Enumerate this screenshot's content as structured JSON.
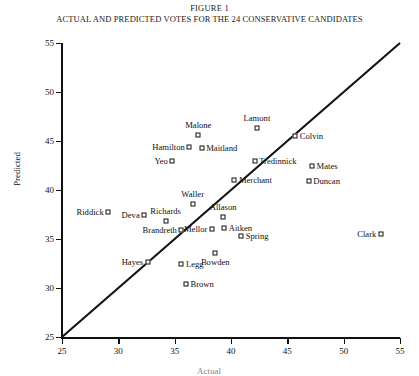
{
  "figure": {
    "title": "FIGURE 1",
    "subtitle": "ACTUAL AND PREDICTED VOTES FOR THE 24 CONSERVATIVE CANDIDATES"
  },
  "chart_data": {
    "type": "scatter",
    "title": "ACTUAL AND PREDICTED VOTES FOR THE 24 CONSERVATIVE CANDIDATES",
    "xlabel": "Actual",
    "ylabel": "Predicted",
    "xlim": [
      25,
      55
    ],
    "ylim": [
      25,
      55
    ],
    "xticks": [
      25,
      30,
      35,
      40,
      45,
      50,
      55
    ],
    "yticks": [
      25,
      30,
      35,
      40,
      45,
      50,
      55
    ],
    "grid": false,
    "legend": null,
    "reference_line": {
      "kind": "identity",
      "from": [
        25,
        25
      ],
      "to": [
        55,
        55
      ],
      "label": "y = x"
    },
    "points": [
      {
        "name": "Riddick",
        "x": 29.1,
        "y": 37.8,
        "label_side": "left"
      },
      {
        "name": "Deva",
        "x": 32.3,
        "y": 37.4,
        "label_side": "left"
      },
      {
        "name": "Richards",
        "x": 34.2,
        "y": 36.8,
        "label_side": "top"
      },
      {
        "name": "Brandreth",
        "x": 35.6,
        "y": 35.9,
        "label_side": "left"
      },
      {
        "name": "Hayes",
        "x": 32.6,
        "y": 32.7,
        "label_side": "left"
      },
      {
        "name": "Legg",
        "x": 35.6,
        "y": 32.4,
        "label_side": "right"
      },
      {
        "name": "Brown",
        "x": 36.0,
        "y": 30.4,
        "label_side": "right"
      },
      {
        "name": "Mellor",
        "x": 38.3,
        "y": 36.0,
        "label_side": "left"
      },
      {
        "name": "Aitken",
        "x": 39.4,
        "y": 36.1,
        "label_side": "right"
      },
      {
        "name": "Allason",
        "x": 39.3,
        "y": 37.2,
        "label_side": "top"
      },
      {
        "name": "Spring",
        "x": 40.9,
        "y": 35.3,
        "label_side": "right"
      },
      {
        "name": "Bowden",
        "x": 38.6,
        "y": 33.6,
        "label_side": "top-b"
      },
      {
        "name": "Waller",
        "x": 36.6,
        "y": 38.6,
        "label_side": "top"
      },
      {
        "name": "Merchant",
        "x": 40.3,
        "y": 41.0,
        "label_side": "right"
      },
      {
        "name": "Yeo",
        "x": 34.8,
        "y": 43.0,
        "label_side": "left"
      },
      {
        "name": "Hamilton",
        "x": 36.3,
        "y": 44.4,
        "label_side": "left"
      },
      {
        "name": "Maitland",
        "x": 37.4,
        "y": 44.3,
        "label_side": "right"
      },
      {
        "name": "Malone",
        "x": 37.1,
        "y": 45.6,
        "label_side": "top"
      },
      {
        "name": "Lamont",
        "x": 42.3,
        "y": 46.3,
        "label_side": "top"
      },
      {
        "name": "Colvin",
        "x": 45.7,
        "y": 45.5,
        "label_side": "right"
      },
      {
        "name": "Tredinnick",
        "x": 42.1,
        "y": 43.0,
        "label_side": "right"
      },
      {
        "name": "Mates",
        "x": 47.2,
        "y": 42.4,
        "label_side": "right"
      },
      {
        "name": "Duncan",
        "x": 46.9,
        "y": 40.9,
        "label_side": "right"
      },
      {
        "name": "Clark",
        "x": 53.3,
        "y": 35.5,
        "label_side": "left"
      }
    ]
  },
  "colors": {
    "ink": "#111111",
    "background": "#ffffff"
  }
}
